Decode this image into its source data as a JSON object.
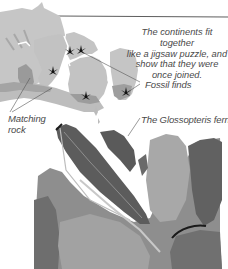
{
  "figure": {
    "type": "educational-diagram",
    "map": {
      "description": "Gondwana continents fitted together",
      "land_color": "#c4c4c4",
      "matching_rock_color": "#9a9a9a",
      "fossil_marker_color": "#111111",
      "fossil_markers": [
        {
          "x": 70,
          "y": 51
        },
        {
          "x": 80,
          "y": 50
        },
        {
          "x": 53,
          "y": 71
        },
        {
          "x": 86,
          "y": 96
        },
        {
          "x": 126,
          "y": 92
        }
      ]
    },
    "labels": {
      "caption_lines": [
        "The continents fit together",
        "like a jigsaw puzzle, and",
        "show that they were",
        "once joined."
      ],
      "fossil_finds": "Fossil finds",
      "matching_rock_line1": "Matching",
      "matching_rock_line2": "rock",
      "fern": "The Glossopteris fern"
    },
    "photo": {
      "subject": "Glossopteris fern fossil leaves in rock",
      "tones": [
        "#5e5e5e",
        "#8a8a8a",
        "#b0b0b0",
        "#3a3a3a"
      ]
    }
  }
}
